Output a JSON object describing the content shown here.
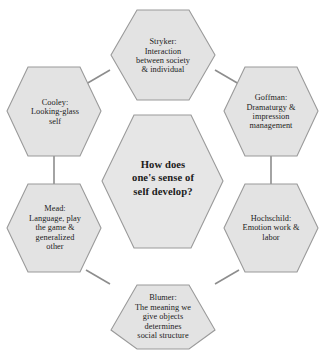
{
  "diagram": {
    "type": "hexagon-cluster",
    "title": "How does one's sense of self develop?",
    "colors": {
      "hex_fill": "#e3e3e3",
      "hex_border": "#9a9a9a",
      "connector": "#8d8d8d",
      "text": "#1b1b1b",
      "background": "#ffffff"
    },
    "center": {
      "id": "center-question",
      "text": "How does\none's sense of\nself develop?",
      "lines": [
        "How does",
        "one's sense of",
        "self develop?"
      ]
    },
    "nodes": [
      {
        "id": "stryker",
        "position": "top",
        "theorist": "Stryker",
        "concept": "Interaction between society & individual",
        "text": "Stryker:\nInteraction\nbetween society\n& individual",
        "lines": [
          "Stryker:",
          "Interaction",
          "between society",
          "& individual"
        ]
      },
      {
        "id": "goffman",
        "position": "top-right",
        "theorist": "Goffman",
        "concept": "Dramaturgy & impression management",
        "text": "Goffman:\nDramaturgy &\nimpression\nmanagement",
        "lines": [
          "Goffman:",
          "Dramaturgy &",
          "impression",
          "management"
        ]
      },
      {
        "id": "hochschild",
        "position": "bottom-right",
        "theorist": "Hochschild",
        "concept": "Emotion work & labor",
        "text": "Hochschild:\nEmotion work &\nlabor",
        "lines": [
          "Hochschild:",
          "Emotion work &",
          "labor"
        ]
      },
      {
        "id": "blumer",
        "position": "bottom",
        "theorist": "Blumer",
        "concept": "The meaning we give objects determines social structure",
        "text": "Blumer:\nThe meaning we\ngive objects\ndetermines\nsocial structure",
        "lines": [
          "Blumer:",
          "The meaning we",
          "give objects",
          "determines",
          "social structure"
        ]
      },
      {
        "id": "mead",
        "position": "bottom-left",
        "theorist": "Mead",
        "concept": "Language, play the game & generalized other",
        "text": "Mead:\nLanguage, play\nthe game &\ngeneralized\nother",
        "lines": [
          "Mead:",
          "Language, play",
          "the game &",
          "generalized",
          "other"
        ]
      },
      {
        "id": "cooley",
        "position": "top-left",
        "theorist": "Cooley",
        "concept": "Looking-glass self",
        "text": "Cooley:\nLooking-glass\nself",
        "lines": [
          "Cooley:",
          "Looking-glass",
          "self"
        ]
      }
    ]
  }
}
